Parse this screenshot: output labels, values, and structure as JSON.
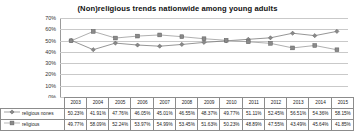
{
  "chart_data": {
    "type": "line",
    "title": "(Non)religious trends nationwide among young adults",
    "xlabel": "",
    "ylabel": "",
    "ylim": [
      0,
      70
    ],
    "ytick_labels": [
      "0%",
      "10%",
      "20%",
      "30%",
      "40%",
      "50%",
      "60%",
      "70%"
    ],
    "ytick_values": [
      0,
      10,
      20,
      30,
      40,
      50,
      60,
      70
    ],
    "grid": true,
    "legend_position": "bottom-table",
    "categories": [
      "2003",
      "2004",
      "2005",
      "2006",
      "2007",
      "2008",
      "2009",
      "2010",
      "2011",
      "2012",
      "2013",
      "2014",
      "2015"
    ],
    "series": [
      {
        "name": "religious nones",
        "marker": "diamond",
        "color": "#7b7b7b",
        "values": [
          50.23,
          41.91,
          47.76,
          46.05,
          45.01,
          46.55,
          48.37,
          49.77,
          51.11,
          52.45,
          56.51,
          54.36,
          58.15
        ],
        "labels": [
          "50.23%",
          "41.91%",
          "47.76%",
          "46.05%",
          "45.01%",
          "46.55%",
          "48.37%",
          "49.77%",
          "51.11%",
          "52.45%",
          "56.51%",
          "54.36%",
          "58.15%"
        ]
      },
      {
        "name": "religious",
        "marker": "square",
        "color": "#9a9a9a",
        "values": [
          49.77,
          58.09,
          52.24,
          53.97,
          54.99,
          53.45,
          51.63,
          50.23,
          48.89,
          47.55,
          43.49,
          45.64,
          41.85
        ],
        "labels": [
          "49.77%",
          "58.09%",
          "52.24%",
          "53.97%",
          "54.99%",
          "53.45%",
          "51.63%",
          "50.23%",
          "48.89%",
          "47.55%",
          "43.49%",
          "45.64%",
          "41.85%"
        ]
      }
    ]
  },
  "icons": {
    "diamond_marker": "diamond-marker-icon",
    "square_marker": "square-marker-icon"
  }
}
